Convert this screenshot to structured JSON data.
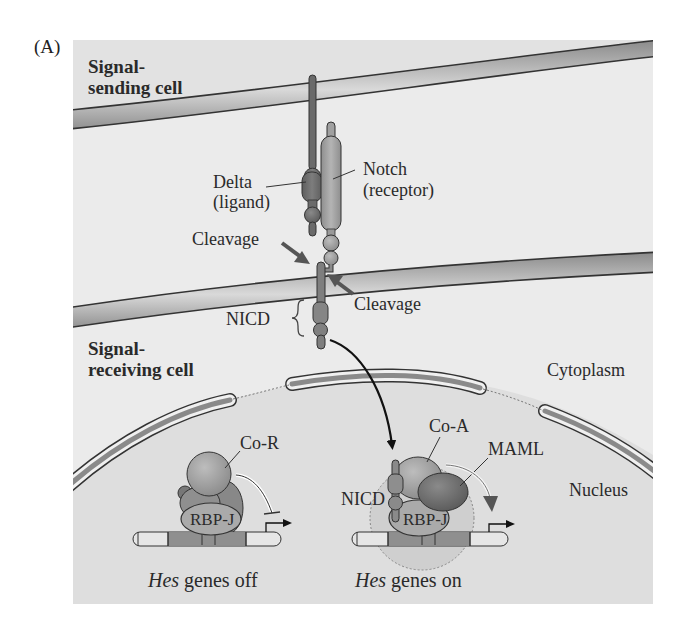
{
  "panel": {
    "label": "(A)"
  },
  "regions": {
    "sending_cell": {
      "line1": "Signal-",
      "line2": "sending cell"
    },
    "receiving_cell": {
      "line1": "Signal-",
      "line2": "receiving cell"
    },
    "cytoplasm": "Cytoplasm",
    "nucleus": "Nucleus"
  },
  "proteins": {
    "delta": {
      "name": "Delta",
      "role": "(ligand)"
    },
    "notch": {
      "name": "Notch",
      "role": "(receptor)"
    },
    "nicd": "NICD",
    "nicd_nuclear": "NICD",
    "co_r": "Co-R",
    "co_a": "Co-A",
    "maml": "MAML",
    "rbpj_off": "RBP-J",
    "rbpj_on": "RBP-J"
  },
  "events": {
    "cleavage_1": "Cleavage",
    "cleavage_2": "Cleavage"
  },
  "captions": {
    "off": {
      "gene": "Hes",
      "state": " genes off"
    },
    "on": {
      "gene": "Hes",
      "state": " genes on"
    }
  },
  "colors": {
    "panel_bg": "#ebebeb",
    "nucleus_bg": "#dcdcdc",
    "membrane_dark": "#3a3a3a",
    "membrane_mid": "#9a9a9a",
    "membrane_light": "#cfcfcf",
    "delta_fill": "#6f6f6f",
    "notch_fill": "#a3a3a3",
    "complex_fill": "#9c9c9c",
    "outline": "#333333"
  }
}
